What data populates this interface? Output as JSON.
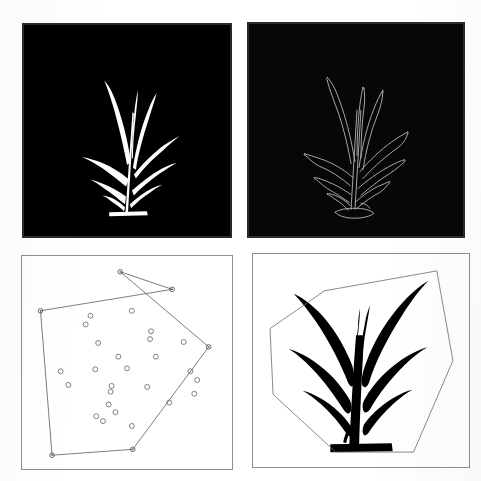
{
  "figure": {
    "title": "",
    "width": 481,
    "height": 481,
    "background_color": "#ffffff",
    "layout": "2x2 grid of image panels",
    "panel_count": 4
  },
  "panels": [
    {
      "id": "top-left",
      "name": "binary-plant-mask",
      "caption": "",
      "kind": "binary-image",
      "background_color": "#000000",
      "foreground_color": "#ffffff",
      "border_color": "#2a2a2a",
      "rect": {
        "x": 22,
        "y": 23,
        "width": 210,
        "height": 215
      },
      "content_description": "White silhouette mask of a grass-like plant on black background"
    },
    {
      "id": "top-right",
      "name": "plant-edge-outline",
      "caption": "",
      "kind": "edge-image",
      "background_color": "#0a0a0a",
      "foreground_color": "#c8c8c8",
      "border_color": "#2a2a2a",
      "rect": {
        "x": 247,
        "y": 22,
        "width": 218,
        "height": 216
      },
      "content_description": "Edge-detected outline of the same plant, thin light contours on black background"
    },
    {
      "id": "bottom-left",
      "name": "convex-hull-scatter",
      "caption": "",
      "kind": "scatter-with-hull",
      "background_color": "#ffffff",
      "border_color": "#8d8d8d",
      "rect": {
        "x": 21,
        "y": 255,
        "width": 212,
        "height": 215
      },
      "content_description": "Scatter of open circle markers with convex hull polygon drawn through the extreme points"
    },
    {
      "id": "bottom-right",
      "name": "plant-hull-overlay",
      "caption": "",
      "kind": "silhouette-with-hull",
      "background_color": "#ffffff",
      "foreground_color": "#000000",
      "border_color": "#8d8d8d",
      "rect": {
        "x": 252,
        "y": 253,
        "width": 218,
        "height": 215
      },
      "content_description": "Inverted black plant silhouette with thin convex hull polygon enclosing it"
    }
  ],
  "chart_data": [
    {
      "type": "scatter",
      "panel": "bottom-left",
      "title": "",
      "xlabel": "",
      "ylabel": "",
      "xlim": [
        0,
        100
      ],
      "ylim": [
        0,
        100
      ],
      "grid": false,
      "legend": null,
      "marker": {
        "style": "open-circle",
        "edge_color": "#6b6b6b",
        "fill_color": "none",
        "size_px": 5
      },
      "points": [
        {
          "x": 31.0,
          "y": 74.0
        },
        {
          "x": 28.5,
          "y": 69.5
        },
        {
          "x": 52.5,
          "y": 76.5
        },
        {
          "x": 35.0,
          "y": 60.0
        },
        {
          "x": 62.5,
          "y": 66.0
        },
        {
          "x": 62.0,
          "y": 62.0
        },
        {
          "x": 79.5,
          "y": 60.5
        },
        {
          "x": 45.5,
          "y": 53.0
        },
        {
          "x": 65.0,
          "y": 53.0
        },
        {
          "x": 15.5,
          "y": 45.5
        },
        {
          "x": 19.5,
          "y": 38.5
        },
        {
          "x": 33.5,
          "y": 46.5
        },
        {
          "x": 50.0,
          "y": 47.0
        },
        {
          "x": 83.0,
          "y": 45.5
        },
        {
          "x": 86.5,
          "y": 41.0
        },
        {
          "x": 85.0,
          "y": 34.0
        },
        {
          "x": 42.0,
          "y": 38.0
        },
        {
          "x": 41.5,
          "y": 35.0
        },
        {
          "x": 60.5,
          "y": 37.5
        },
        {
          "x": 72.0,
          "y": 29.5
        },
        {
          "x": 40.5,
          "y": 28.5
        },
        {
          "x": 34.0,
          "y": 22.5
        },
        {
          "x": 37.5,
          "y": 20.0
        },
        {
          "x": 44.0,
          "y": 24.5
        },
        {
          "x": 52.5,
          "y": 17.5
        }
      ],
      "hull": {
        "name": "convex-hull-polygon",
        "line_color": "#5a5a5a",
        "line_width": 0.8,
        "vertex_marker": "open-circle",
        "vertices": [
          {
            "x": 46.5,
            "y": 96.5
          },
          {
            "x": 92.5,
            "y": 58.0
          },
          {
            "x": 53.0,
            "y": 5.5
          },
          {
            "x": 11.0,
            "y": 2.5
          },
          {
            "x": 5.0,
            "y": 76.5
          },
          {
            "x": 73.5,
            "y": 87.5
          }
        ],
        "vertex_count": 6
      }
    },
    {
      "type": "scatter",
      "panel": "bottom-right",
      "title": "",
      "xlabel": "",
      "ylabel": "",
      "xlim": [
        0,
        100
      ],
      "ylim": [
        0,
        100
      ],
      "grid": false,
      "legend": null,
      "hull": {
        "name": "plant-convex-hull-polygon",
        "line_color": "#6a6a6a",
        "line_width": 0.8,
        "vertices": [
          {
            "x": 87.5,
            "y": 95.0
          },
          {
            "x": 32.0,
            "y": 85.0
          },
          {
            "x": 5.0,
            "y": 66.0
          },
          {
            "x": 6.5,
            "y": 33.0
          },
          {
            "x": 37.5,
            "y": 4.0
          },
          {
            "x": 76.0,
            "y": 4.0
          },
          {
            "x": 95.5,
            "y": 50.0
          }
        ],
        "vertex_count": 7
      },
      "silhouette": {
        "name": "plant-silhouette",
        "fill_color": "#000000",
        "description": "Filled black grass plant: central vertical stem with 4 long arching leaves on the left and 4 on the right, two narrow upright blades near the top center, and a flat soil/base bar at the bottom"
      }
    }
  ],
  "colors": {
    "page_background": "#ffffff",
    "mask_background": "#000000",
    "mask_foreground": "#ffffff",
    "plot_border": "#8d8d8d",
    "hull_line": "#5a5a5a",
    "marker_edge": "#6b6b6b",
    "silhouette": "#000000",
    "edge_outline": "#c8c8c8"
  }
}
